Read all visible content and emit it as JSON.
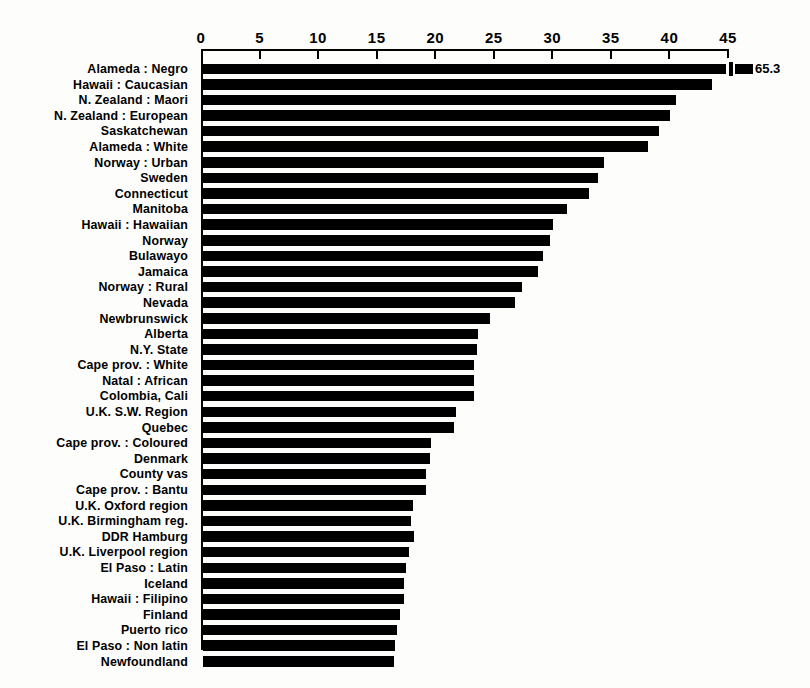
{
  "chart_data": {
    "type": "bar",
    "orientation": "horizontal",
    "title": "",
    "subtitle": "",
    "xlabel": "",
    "ylabel": "",
    "xlim": [
      0,
      45
    ],
    "grid": false,
    "legend": null,
    "xticks": [
      0,
      5,
      10,
      15,
      20,
      25,
      30,
      35,
      40,
      45
    ],
    "xtick_labels": [
      "0",
      "5",
      "10",
      "15",
      "20",
      "25",
      "30",
      "35",
      "40",
      "45"
    ],
    "axis_break_note": "Top bar exceeds the axis maximum; drawn with a break mark and its value printed at the right.",
    "categories": [
      "Alameda : Negro",
      "Hawaii : Caucasian",
      "N. Zealand : Maori",
      "N. Zealand : European",
      "Saskatchewan",
      "Alameda : White",
      "Norway : Urban",
      "Sweden",
      "Connecticut",
      "Manitoba",
      "Hawaii : Hawaiian",
      "Norway",
      "Bulawayo",
      "Jamaica",
      "Norway : Rural",
      "Nevada",
      "Newbrunswick",
      "Alberta",
      "N.Y. State",
      "Cape prov. : White",
      "Natal : African",
      "Colombia, Cali",
      "U.K. S.W. Region",
      "Quebec",
      "Cape prov. : Coloured",
      "Denmark",
      "County vas",
      "Cape prov. : Bantu",
      "U.K. Oxford region",
      "U.K. Birmingham reg.",
      "DDR Hamburg",
      "U.K. Liverpool region",
      "El Paso : Latin",
      "Iceland",
      "Hawaii : Filipino",
      "Finland",
      "Puerto rico",
      "El Paso : Non latin",
      "Newfoundland"
    ],
    "values": [
      65.3,
      43.5,
      40.4,
      39.9,
      38.9,
      38.0,
      34.2,
      33.7,
      33.0,
      31.1,
      29.9,
      29.6,
      29.0,
      28.6,
      27.2,
      26.6,
      24.5,
      23.5,
      23.4,
      23.1,
      23.1,
      23.1,
      21.6,
      21.4,
      19.5,
      19.4,
      19.0,
      19.0,
      17.9,
      17.8,
      18.0,
      17.6,
      17.3,
      17.2,
      17.2,
      16.8,
      16.6,
      16.4,
      16.3
    ],
    "value_labels": {
      "0": "65.3"
    }
  },
  "style": {
    "bar_color": "#000000",
    "axis_color": "#000000",
    "background": "#ffffff"
  }
}
